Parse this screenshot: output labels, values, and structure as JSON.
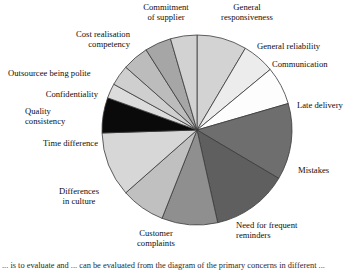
{
  "chart_data": {
    "type": "pie",
    "title": "",
    "xlabel": "",
    "ylabel": "",
    "legend_position": "none",
    "grid": false,
    "start_angle_deg": 0,
    "direction": "clockwise",
    "center": {
      "x": 197,
      "y": 130
    },
    "radius": 95,
    "categories": [
      "General responsiveness",
      "General reliability",
      "Communication",
      "Late delivery",
      "Mistakes",
      "Need for frequent reminders",
      "Customer complaints",
      "Differences in culture",
      "Time difference",
      "Quality consistency",
      "Confidentiality",
      "Outsourcee being polite",
      "Cost realisation competency",
      "Commitment of supplier"
    ],
    "values": [
      8.5,
      5.5,
      6.5,
      13.0,
      13.0,
      9.5,
      7.5,
      11.0,
      6.0,
      2.5,
      3.5,
      4.5,
      4.5,
      4.5
    ],
    "colors": [
      "#d3d3d3",
      "#ececec",
      "#fdfdfd",
      "#6e6e6e",
      "#5f5f5f",
      "#8f8f8f",
      "#c0c0c0",
      "#d7d7d7",
      "#0a0a0a",
      "#dcdcdc",
      "#cfcfcf",
      "#bcbcbc",
      "#a6a6a6",
      "#d2d2d2"
    ],
    "stroke_color": "#3a3a3a",
    "slice_labels_visible": true
  },
  "labels": {
    "commitment_of_supplier": "Commitment\nof supplier",
    "general_responsiveness": "General\nresponsiveness",
    "general_reliability": "General reliability",
    "communication": "Communication",
    "late_delivery": "Late delivery",
    "mistakes": "Mistakes",
    "need_for_frequent_reminders": "Need for frequent\nreminders",
    "customer_complaints": "Customer\ncomplaints",
    "differences_in_culture": "Differences\nin culture",
    "time_difference": "Time difference",
    "quality_consistency": "Quality\nconsistency",
    "confidentiality": "Confidentiality",
    "outsourcee_being_polite": "Outsourcee being polite",
    "cost_realisation_competency": "Cost realisation\ncompetency"
  },
  "caption": {
    "text": "... is to evaluate and ... can be evaluated from the diagram of the primary concerns in different ..."
  }
}
